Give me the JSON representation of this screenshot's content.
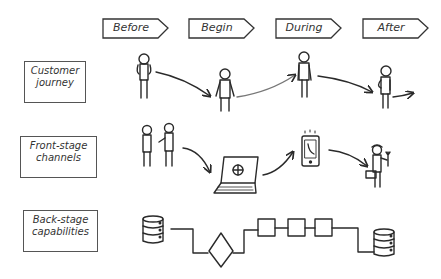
{
  "phases": [
    {
      "label": "Before"
    },
    {
      "label": "Begin"
    },
    {
      "label": "During"
    },
    {
      "label": "After"
    }
  ],
  "lanes": [
    {
      "label_line1": "Customer",
      "label_line2": "journey"
    },
    {
      "label_line1": "Front-stage",
      "label_line2": "channels"
    },
    {
      "label_line1": "Back-stage",
      "label_line2": "capabilities"
    }
  ],
  "lane_contents": {
    "customer_journey": [
      "stick-figure-before",
      "stick-figure-begin",
      "stick-figure-during",
      "stick-figure-after"
    ],
    "front_stage_channels": [
      "two-people-talking",
      "laptop-with-globe",
      "mobile-phone-call",
      "technician-with-toolbox-and-wrench"
    ],
    "back_stage_capabilities": [
      "database",
      "decision-diamond",
      "process-box",
      "process-box",
      "process-box",
      "database"
    ]
  },
  "colors": {
    "ink": "#2a2a2a",
    "background": "#ffffff"
  }
}
